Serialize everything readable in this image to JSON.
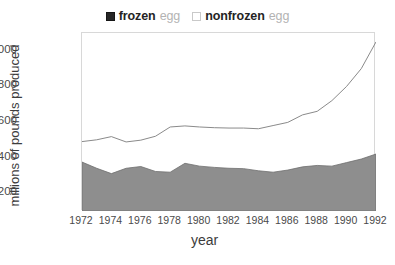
{
  "legend": {
    "items": [
      {
        "marker": "filled-square-swatch",
        "strong": "frozen",
        "weak": "egg"
      },
      {
        "marker": "empty-square-swatch",
        "strong": "nonfrozen",
        "weak": "egg"
      }
    ]
  },
  "axes": {
    "ylabel": "millions of pounds produced",
    "xlabel": "year",
    "yticks": [
      "200",
      "400",
      "600",
      "800",
      "1000"
    ],
    "xticks": [
      "1972",
      "1974",
      "1976",
      "1978",
      "1980",
      "1982",
      "1984",
      "1986",
      "1988",
      "1990",
      "1992"
    ]
  },
  "colors": {
    "frozen_fill": "#8e8e8e",
    "frozen_edge": "#6f6f6f",
    "nonfrozen_line": "#8a8a8a",
    "frame": "#d8d8d8",
    "text": "#3c3c3c",
    "legend_weak": "#b3b3b3"
  },
  "chart_data": {
    "type": "area",
    "title": "",
    "subtitle": "",
    "xlabel": "year",
    "ylabel": "millions of pounds produced",
    "xlim": [
      1972,
      1992
    ],
    "ylim": [
      100,
      1100
    ],
    "grid": false,
    "stacked": true,
    "legend_position": "top-center",
    "x": [
      1972,
      1973,
      1974,
      1975,
      1976,
      1977,
      1978,
      1979,
      1980,
      1981,
      1982,
      1983,
      1984,
      1985,
      1986,
      1987,
      1988,
      1989,
      1990,
      1991,
      1992
    ],
    "series": [
      {
        "name": "frozen egg",
        "style": "filled-area",
        "values": [
          375,
          340,
          310,
          340,
          350,
          322,
          318,
          368,
          352,
          345,
          340,
          338,
          326,
          318,
          330,
          348,
          356,
          352,
          372,
          392,
          420
        ]
      },
      {
        "name": "nonfrozen egg",
        "style": "line-top-of-stack",
        "note": "upper boundary is cumulative total (frozen + nonfrozen)",
        "cumulative_values": [
          490,
          500,
          518,
          488,
          498,
          520,
          572,
          578,
          572,
          568,
          566,
          566,
          562,
          580,
          598,
          640,
          660,
          720,
          800,
          900,
          1050
        ],
        "values": [
          115,
          160,
          208,
          148,
          148,
          198,
          254,
          210,
          220,
          223,
          226,
          228,
          236,
          262,
          268,
          292,
          304,
          368,
          428,
          508,
          630
        ]
      }
    ]
  }
}
